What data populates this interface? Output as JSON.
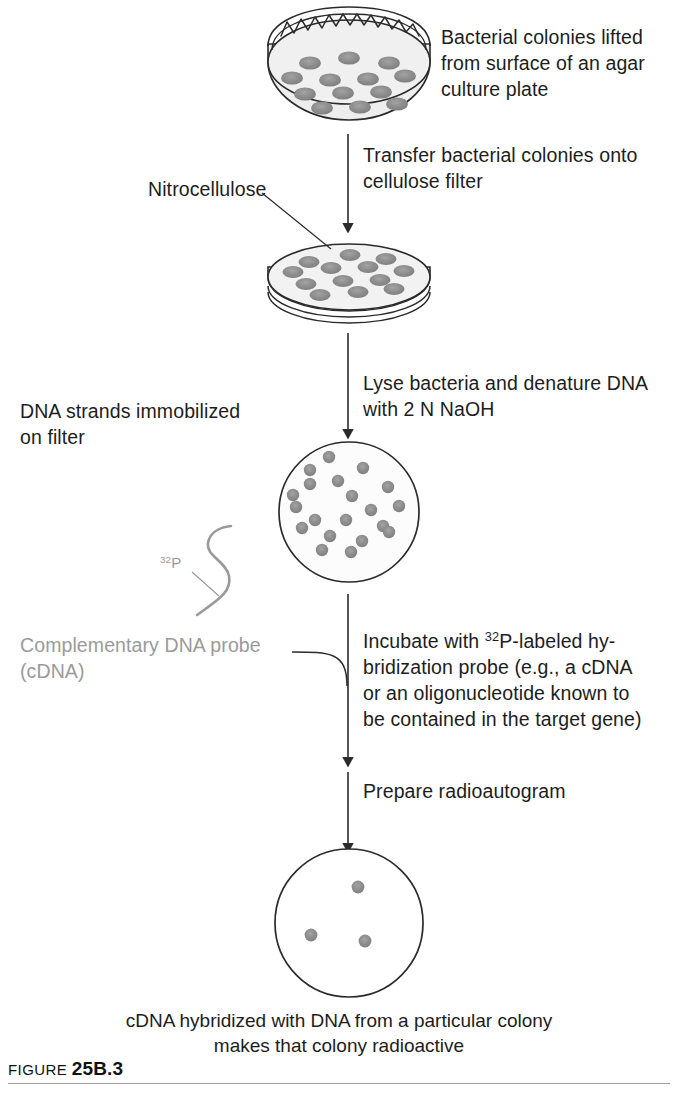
{
  "figure": {
    "label_word": "FIGURE",
    "label_number": "25B.3"
  },
  "steps": {
    "top_right_note": "Bacterial colonies lifted\nfrom surface of an agar\nculture plate",
    "step1_arrow_text": "Transfer bacterial colonies onto\ncellulose filter",
    "nitrocellulose_label": "Nitrocellulose",
    "step2_arrow_text": "Lyse bacteria and denature DNA\nwith 2 N NaOH",
    "dna_strands_label": "DNA strands immobilized\non filter",
    "probe_isotope_label_base": "32",
    "probe_isotope_label_element": "P",
    "probe_label": "Complementary DNA probe\n(cDNA)",
    "step3_line1_pre": "Incubate with ",
    "step3_line1_sup": "32",
    "step3_line1_post": "P-labeled hy-",
    "step3_line2": "bridization probe (e.g., a cDNA",
    "step3_line3": "or an oligonucleotide known to",
    "step3_line4": "be contained in the target gene)",
    "step4_arrow_text": "Prepare radioautogram"
  },
  "caption": "cDNA hybridized with DNA from a particular colony\nmakes that colony radioactive",
  "diagram": {
    "stage1_name": "agar-culture-plate",
    "stage2_name": "nitrocellulose-filter-disc",
    "stage3_name": "filter-with-immobilized-dna",
    "stage4_name": "radioautogram",
    "stage1_colony_count": 13,
    "stage2_colony_count": 13,
    "stage3_spot_count": 20,
    "stage4_spot_count": 3,
    "colors": {
      "line": "#2b2b2b",
      "dish_face": "#ededed",
      "colony": "#8c8c8c",
      "colony_edge": "#6f6f6f",
      "probe_gray": "#9a9a9a",
      "text": "#1d1d1d",
      "rule": "#9d9d9d"
    },
    "stage1_colonies": [
      [
        310,
        63
      ],
      [
        349,
        58
      ],
      [
        389,
        63
      ],
      [
        292,
        78
      ],
      [
        330,
        80
      ],
      [
        368,
        79
      ],
      [
        405,
        76
      ],
      [
        305,
        94
      ],
      [
        343,
        93
      ],
      [
        381,
        92
      ],
      [
        322,
        108
      ],
      [
        360,
        107
      ],
      [
        397,
        104
      ]
    ],
    "stage2_colonies": [
      [
        309,
        262
      ],
      [
        350,
        255
      ],
      [
        386,
        259
      ],
      [
        293,
        272
      ],
      [
        331,
        268
      ],
      [
        368,
        267
      ],
      [
        404,
        271
      ],
      [
        306,
        284
      ],
      [
        343,
        281
      ],
      [
        380,
        280
      ],
      [
        320,
        295
      ],
      [
        358,
        292
      ],
      [
        394,
        289
      ]
    ],
    "stage3_spots": [
      [
        329,
        457
      ],
      [
        363,
        468
      ],
      [
        310,
        484
      ],
      [
        338,
        481
      ],
      [
        388,
        487
      ],
      [
        293,
        495
      ],
      [
        352,
        496
      ],
      [
        296,
        507
      ],
      [
        371,
        510
      ],
      [
        399,
        506
      ],
      [
        315,
        520
      ],
      [
        346,
        520
      ],
      [
        302,
        528
      ],
      [
        383,
        526
      ],
      [
        330,
        536
      ],
      [
        362,
        541
      ],
      [
        389,
        532
      ],
      [
        322,
        550
      ],
      [
        351,
        552
      ],
      [
        310,
        470
      ]
    ],
    "stage4_spots": [
      [
        358,
        887
      ],
      [
        311,
        935
      ],
      [
        365,
        941
      ]
    ]
  }
}
